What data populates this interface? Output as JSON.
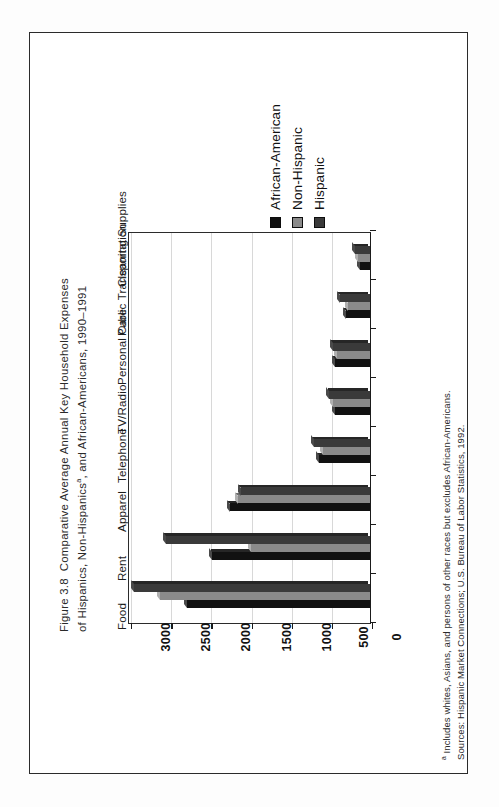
{
  "figure": {
    "number": "Figure 3.8",
    "title_line1": "Comparative Average Annual Key Household Expenses",
    "title_line2_a": "of Hispanics, Non-Hispanics",
    "title_line2_sup": "a",
    "title_line2_b": ", and African-Americans, 1990–1991"
  },
  "legend": {
    "position": "top-right",
    "items": [
      {
        "label": "African-American",
        "color": "#111111"
      },
      {
        "label": "Non-Hispanic",
        "color": "#8a8a8a"
      },
      {
        "label": "Hispanic",
        "color": "#3a3a3a"
      }
    ]
  },
  "footnote": {
    "marker": "a",
    "line1": " Includes whites, Asians, and persons of other races but excludes African-Americans.",
    "line2": "Sources: Hispanic Market Connections; U.S. Bureau of Labor Statistics, 1992."
  },
  "chart_data": {
    "type": "bar",
    "orientation": "vertical-bars-printed-sideways",
    "xlabel": "",
    "ylabel": "",
    "ylim": [
      0,
      3000
    ],
    "yticks": [
      0,
      500,
      1000,
      1500,
      2000,
      2500,
      3000
    ],
    "ticklabels": [
      "0",
      "500",
      "1000",
      "1500",
      "2000",
      "2500",
      "3000"
    ],
    "grid": true,
    "legend_position": "top-right",
    "categories": [
      "Food",
      "Rent",
      "Apparel",
      "Telephone",
      "TV/Radio",
      "Personal Care",
      "Public Transportation",
      "Cleaning Supplies"
    ],
    "series": [
      {
        "name": "African-American",
        "color": "#111111",
        "values": [
          2300,
          1980,
          1760,
          640,
          440,
          440,
          300,
          130
        ]
      },
      {
        "name": "Non-Hispanic",
        "color": "#8a8a8a",
        "values": [
          2640,
          1500,
          1660,
          590,
          470,
          420,
          280,
          150
        ]
      },
      {
        "name": "Hispanic",
        "color": "#3a3a3a",
        "values": [
          2960,
          2560,
          1620,
          700,
          510,
          470,
          380,
          190
        ]
      }
    ]
  }
}
